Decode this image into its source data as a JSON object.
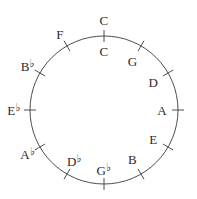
{
  "figure": {
    "name": "circle-of-fifths",
    "stroke_color": "#3a3a3a",
    "text_color": "#2b2b2b",
    "background_color": "#ffffff",
    "circle": {
      "cx": 104,
      "cy": 110,
      "r": 74
    },
    "tick": {
      "inner_offset": 6,
      "outer_offset": 6
    }
  },
  "chart_data": {
    "type": "scatter",
    "title": "",
    "xlabel": "",
    "ylabel": "",
    "grid": false,
    "legend": "none",
    "categories": [
      "C",
      "G",
      "D",
      "A",
      "E",
      "B",
      "G♭",
      "D♭",
      "A♭",
      "E♭",
      "B♭",
      "F"
    ],
    "values": [
      0,
      30,
      60,
      90,
      120,
      150,
      180,
      210,
      240,
      270,
      300,
      330
    ],
    "units": "degrees clockwise from top"
  },
  "nodes": [
    {
      "id": "c-outer",
      "note": "C",
      "accidental": "",
      "angle_deg": 0,
      "placement": "outside",
      "label_radius": 90
    },
    {
      "id": "c-inner",
      "note": "C",
      "accidental": "",
      "angle_deg": 0,
      "placement": "inside",
      "label_radius": 59
    },
    {
      "id": "g",
      "note": "G",
      "accidental": "",
      "angle_deg": 30,
      "placement": "inside",
      "label_radius": 57
    },
    {
      "id": "d",
      "note": "D",
      "accidental": "",
      "angle_deg": 60,
      "placement": "inside",
      "label_radius": 57
    },
    {
      "id": "a",
      "note": "A",
      "accidental": "",
      "angle_deg": 90,
      "placement": "inside",
      "label_radius": 58
    },
    {
      "id": "e",
      "note": "E",
      "accidental": "",
      "angle_deg": 120,
      "placement": "inside",
      "label_radius": 57
    },
    {
      "id": "b",
      "note": "B",
      "accidental": "",
      "angle_deg": 150,
      "placement": "inside",
      "label_radius": 57
    },
    {
      "id": "gb",
      "note": "G",
      "accidental": "♭",
      "angle_deg": 180,
      "placement": "inside",
      "label_radius": 60
    },
    {
      "id": "db",
      "note": "D",
      "accidental": "♭",
      "angle_deg": 210,
      "placement": "inside",
      "label_radius": 59
    },
    {
      "id": "ab",
      "note": "A",
      "accidental": "♭",
      "angle_deg": 240,
      "placement": "outside",
      "label_radius": 88
    },
    {
      "id": "eb",
      "note": "E",
      "accidental": "♭",
      "angle_deg": 270,
      "placement": "outside",
      "label_radius": 90
    },
    {
      "id": "bb",
      "note": "B",
      "accidental": "♭",
      "angle_deg": 300,
      "placement": "outside",
      "label_radius": 88
    },
    {
      "id": "f",
      "note": "F",
      "accidental": "",
      "angle_deg": 330,
      "placement": "outside",
      "label_radius": 88
    }
  ],
  "labels": {
    "c_top": "C",
    "c_inner": "C",
    "g": "G",
    "d": "D",
    "a": "A",
    "e": "E",
    "b": "B",
    "g_flat": "G♭",
    "d_flat": "D♭",
    "a_flat": "A♭",
    "e_flat": "E♭",
    "b_flat": "B♭",
    "f": "F"
  }
}
